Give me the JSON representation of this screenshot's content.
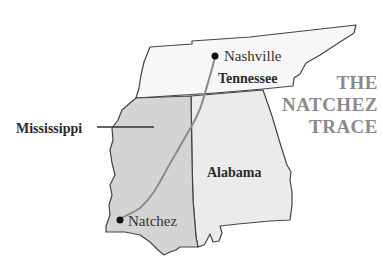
{
  "title": {
    "lines": [
      "THE",
      "NATCHEZ",
      "TRACE"
    ],
    "color": "#8a8a8a"
  },
  "states": [
    {
      "name": "Tennessee",
      "fill": "#f7f7f7"
    },
    {
      "name": "Mississippi",
      "fill": "#d4d4d4"
    },
    {
      "name": "Alabama",
      "fill": "#ebebeb"
    }
  ],
  "cities": [
    {
      "name": "Nashville"
    },
    {
      "name": "Natchez"
    }
  ],
  "route": {
    "name": "Natchez Trace",
    "color": "#8c8c8c"
  },
  "border_color": "#444444"
}
